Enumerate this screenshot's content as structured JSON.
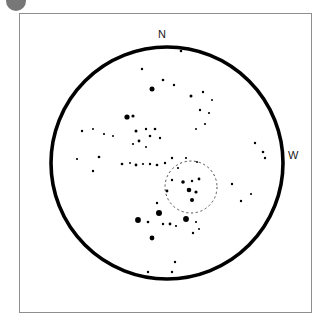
{
  "figure": {
    "type": "star-chart",
    "corner_mark": "figure-bullet-mark"
  },
  "frame": {
    "border_color": "#8e8e8e",
    "background": "#ffffff",
    "x": 19,
    "y": 13,
    "width": 293,
    "height": 300
  },
  "field_of_view": {
    "label": "field-of-view-circle",
    "center_x": 167,
    "center_y": 163,
    "radius": 116,
    "stroke_color": "#000000",
    "stroke_width": 3.6
  },
  "target_circle": {
    "label": "target-marker-circle",
    "center_x": 191,
    "center_y": 187,
    "radius": 26,
    "stroke_color": "#4f4f4f",
    "stroke_width": 1,
    "dash": "2.2 2.6"
  },
  "direction_labels": [
    {
      "id": "north",
      "text": "N",
      "x": 158,
      "y": 29
    },
    {
      "id": "west",
      "text": "W",
      "x": 288,
      "y": 150
    }
  ],
  "chart_data": {
    "type": "scatter",
    "title": "",
    "xlabel": "",
    "ylabel": "",
    "grid": false,
    "legend": null,
    "note": "Star positions in screenshot pixel coordinates; r is plotted dot radius encoding stellar magnitude (larger = brighter).",
    "star_color": "#000000",
    "stars": [
      {
        "x": 181,
        "y": 51,
        "r": 1.3
      },
      {
        "x": 142,
        "y": 69,
        "r": 1.2
      },
      {
        "x": 163,
        "y": 80,
        "r": 1.3
      },
      {
        "x": 152,
        "y": 89,
        "r": 2.5
      },
      {
        "x": 174,
        "y": 85,
        "r": 1.2
      },
      {
        "x": 191,
        "y": 96,
        "r": 1.5
      },
      {
        "x": 203,
        "y": 92,
        "r": 1.2
      },
      {
        "x": 212,
        "y": 100,
        "r": 1.0
      },
      {
        "x": 200,
        "y": 110,
        "r": 1.2
      },
      {
        "x": 209,
        "y": 113,
        "r": 1.1
      },
      {
        "x": 205,
        "y": 124,
        "r": 1.1
      },
      {
        "x": 196,
        "y": 129,
        "r": 1.0
      },
      {
        "x": 127,
        "y": 117,
        "r": 2.6
      },
      {
        "x": 133,
        "y": 116,
        "r": 1.6
      },
      {
        "x": 82,
        "y": 131,
        "r": 1.2
      },
      {
        "x": 93,
        "y": 129,
        "r": 1.0
      },
      {
        "x": 104,
        "y": 134,
        "r": 1.1
      },
      {
        "x": 113,
        "y": 136,
        "r": 1.0
      },
      {
        "x": 136,
        "y": 131,
        "r": 1.5
      },
      {
        "x": 146,
        "y": 129,
        "r": 1.2
      },
      {
        "x": 155,
        "y": 129,
        "r": 1.3
      },
      {
        "x": 150,
        "y": 136,
        "r": 1.3
      },
      {
        "x": 160,
        "y": 138,
        "r": 1.2
      },
      {
        "x": 139,
        "y": 141,
        "r": 1.4
      },
      {
        "x": 133,
        "y": 144,
        "r": 1.1
      },
      {
        "x": 146,
        "y": 147,
        "r": 1.0
      },
      {
        "x": 77,
        "y": 159,
        "r": 1.1
      },
      {
        "x": 99,
        "y": 157,
        "r": 1.3
      },
      {
        "x": 93,
        "y": 171,
        "r": 1.2
      },
      {
        "x": 122,
        "y": 164,
        "r": 1.3
      },
      {
        "x": 130,
        "y": 163,
        "r": 1.0
      },
      {
        "x": 136,
        "y": 165,
        "r": 1.4
      },
      {
        "x": 143,
        "y": 164,
        "r": 1.1
      },
      {
        "x": 150,
        "y": 164,
        "r": 1.2
      },
      {
        "x": 157,
        "y": 165,
        "r": 1.3
      },
      {
        "x": 165,
        "y": 163,
        "r": 1.2
      },
      {
        "x": 172,
        "y": 158,
        "r": 1.2
      },
      {
        "x": 178,
        "y": 168,
        "r": 1.1
      },
      {
        "x": 186,
        "y": 158,
        "r": 1.1
      },
      {
        "x": 197,
        "y": 162,
        "r": 1.0
      },
      {
        "x": 172,
        "y": 180,
        "r": 1.2
      },
      {
        "x": 183,
        "y": 182,
        "r": 1.8
      },
      {
        "x": 192,
        "y": 181,
        "r": 1.2
      },
      {
        "x": 199,
        "y": 179,
        "r": 1.4
      },
      {
        "x": 189,
        "y": 190,
        "r": 2.3
      },
      {
        "x": 196,
        "y": 192,
        "r": 1.6
      },
      {
        "x": 167,
        "y": 191,
        "r": 1.4
      },
      {
        "x": 192,
        "y": 200,
        "r": 2.0
      },
      {
        "x": 232,
        "y": 184,
        "r": 1.2
      },
      {
        "x": 255,
        "y": 143,
        "r": 1.2
      },
      {
        "x": 263,
        "y": 152,
        "r": 1.3
      },
      {
        "x": 265,
        "y": 158,
        "r": 1.2
      },
      {
        "x": 251,
        "y": 194,
        "r": 1.1
      },
      {
        "x": 241,
        "y": 201,
        "r": 1.2
      },
      {
        "x": 159,
        "y": 213,
        "r": 3.0
      },
      {
        "x": 138,
        "y": 220,
        "r": 2.9
      },
      {
        "x": 186,
        "y": 219,
        "r": 2.9
      },
      {
        "x": 152,
        "y": 238,
        "r": 2.4
      },
      {
        "x": 148,
        "y": 222,
        "r": 1.3
      },
      {
        "x": 163,
        "y": 224,
        "r": 1.2
      },
      {
        "x": 170,
        "y": 224,
        "r": 1.4
      },
      {
        "x": 176,
        "y": 226,
        "r": 1.1
      },
      {
        "x": 196,
        "y": 222,
        "r": 1.1
      },
      {
        "x": 199,
        "y": 229,
        "r": 1.0
      },
      {
        "x": 193,
        "y": 233,
        "r": 1.2
      },
      {
        "x": 157,
        "y": 203,
        "r": 1.2
      },
      {
        "x": 175,
        "y": 262,
        "r": 1.2
      },
      {
        "x": 148,
        "y": 272,
        "r": 1.2
      },
      {
        "x": 172,
        "y": 272,
        "r": 1.2
      }
    ]
  }
}
